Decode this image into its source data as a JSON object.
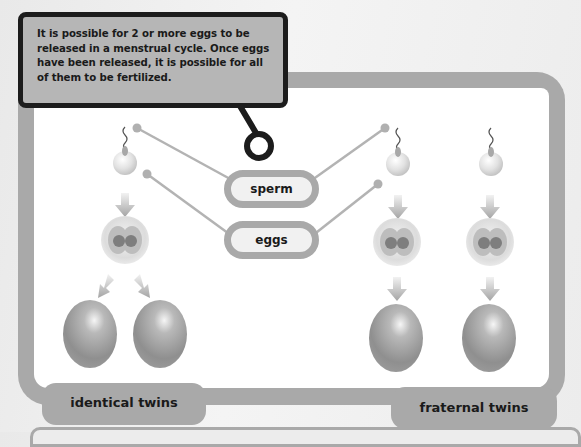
{
  "callout": {
    "text": "It is possible for 2 or more eggs to be released in a menstrual cycle. Once eggs have been released, it is possible for all of them to be fertilized."
  },
  "labels": {
    "sperm": "sperm",
    "eggs": "eggs"
  },
  "groups": [
    {
      "label": "identical twins",
      "sperm_count": 1,
      "eggs_count": 1,
      "embryos": 2
    },
    {
      "label": "fraternal twins",
      "sperm_count": 2,
      "eggs_count": 2,
      "embryos": 2
    }
  ],
  "colors": {
    "frame": "#a9a9a9",
    "callout_fill": "#b6b6b6",
    "callout_border": "#1c1c1c",
    "background": "#eeeeee",
    "panel": "#ffffff"
  },
  "icons": {
    "sperm": "sperm-icon",
    "egg_cell": "fertilized-egg-icon",
    "embryo_two_cell": "two-cell-embryo-icon",
    "embryo": "embryo-egg-icon",
    "arrow": "arrow-down-icon"
  }
}
